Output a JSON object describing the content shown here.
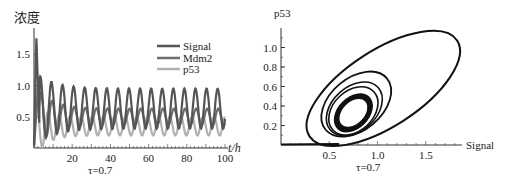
{
  "chart_data": [
    {
      "type": "line",
      "panel": "left",
      "ylabel": "浓度",
      "xlabel": "t/h",
      "caption": "τ=0.7",
      "xlim": [
        0,
        100
      ],
      "ylim": [
        0,
        1.9
      ],
      "xticks": [
        20,
        40,
        60,
        80,
        100
      ],
      "yticks": [
        0.5,
        1.0,
        1.5
      ],
      "legend": {
        "position": "upper right",
        "entries": [
          "Signal",
          "Mdm2",
          "p53"
        ]
      },
      "series": [
        {
          "name": "Signal",
          "color": "#555555",
          "peak_initial": 1.8,
          "oscillation_range": [
            0.3,
            0.95
          ],
          "period": 5.8
        },
        {
          "name": "Mdm2",
          "color": "#6e6e6e",
          "peak_initial": 1.15,
          "oscillation_range": [
            0.35,
            0.65
          ],
          "period": 5.8
        },
        {
          "name": "p53",
          "color": "#b0b0b0",
          "peak_initial": 1.15,
          "oscillation_range": [
            0.2,
            0.5
          ],
          "period": 5.8
        }
      ]
    },
    {
      "type": "line",
      "panel": "right",
      "subtype": "phase-portrait",
      "ylabel": "p53",
      "xlabel": "Signal",
      "caption": "τ=0.7",
      "xlim": [
        0,
        2.0
      ],
      "ylim": [
        0,
        1.2
      ],
      "xticks": [
        0.5,
        1.0,
        1.5
      ],
      "yticks": [
        0.2,
        0.4,
        0.6,
        0.8,
        1.0
      ],
      "trajectory_loops": [
        {
          "center": [
            1.05,
            0.55
          ],
          "x_range": [
            0.3,
            1.82
          ],
          "y_range": [
            0.05,
            1.15
          ]
        },
        {
          "center": [
            0.78,
            0.4
          ],
          "x_range": [
            0.45,
            1.12
          ],
          "y_range": [
            0.1,
            0.76
          ]
        },
        {
          "center": [
            0.75,
            0.35
          ],
          "x_range": [
            0.52,
            1.0
          ],
          "y_range": [
            0.15,
            0.6
          ]
        }
      ],
      "limit_cycle": {
        "center": [
          0.75,
          0.33
        ],
        "x_range": [
          0.58,
          0.92
        ],
        "y_range": [
          0.18,
          0.52
        ]
      }
    }
  ]
}
